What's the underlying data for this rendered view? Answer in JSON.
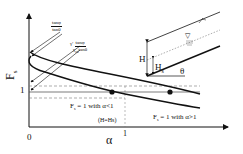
{
  "diagram": {
    "y_axis_label": "F",
    "y_axis_label_sub": "s",
    "y_tick_1": "1",
    "x_axis_label": "α",
    "x_tick_0": "0",
    "x_tick_1": "1",
    "annotation_upper": {
      "numerator": "tanφ",
      "denominator": "tanθ"
    },
    "annotation_lower": {
      "prefix": "γ'",
      "numerator": "tanφ",
      "denominator": "γ",
      "denominator_sub": "sat",
      "denominator_tail": "tanθ"
    },
    "label_alpha_lt_1": "F",
    "label_alpha_lt_1_sub": "s",
    "label_alpha_lt_1_tail": " = 1 with α<1",
    "label_alpha_gt_1": "F",
    "label_alpha_gt_1_sub": "s",
    "label_alpha_gt_1_tail": " = 1 with α>1",
    "label_h_eq_hs": "(H=Hs)",
    "slope_inset": {
      "label_H": "H",
      "label_Hs": "H",
      "label_Hs_sub": "s",
      "label_theta": "θ",
      "water_table_symbol": "▽"
    },
    "colors": {
      "line": "#111111",
      "dashed": "#666666",
      "background": "#ffffff"
    }
  }
}
